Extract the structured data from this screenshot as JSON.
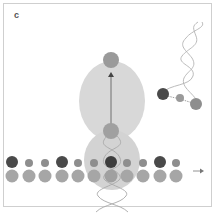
{
  "panel": {
    "label": "c"
  },
  "colors": {
    "dark_circle": "#4a4a4a",
    "mid_circle": "#8a8a8a",
    "light_circle": "#a6a6a6",
    "blob": "#d6d6d6",
    "strand": "#b5b5b5",
    "frame": "#cfcfcf"
  },
  "membrane": {
    "top_row": [
      {
        "x": 12,
        "r": 6,
        "tone": "dark"
      },
      {
        "x": 29,
        "r": 4,
        "tone": "mid"
      },
      {
        "x": 45,
        "r": 4,
        "tone": "mid"
      },
      {
        "x": 62,
        "r": 6,
        "tone": "dark"
      },
      {
        "x": 78,
        "r": 4,
        "tone": "mid"
      },
      {
        "x": 94,
        "r": 4,
        "tone": "mid"
      },
      {
        "x": 111,
        "r": 6,
        "tone": "dark"
      },
      {
        "x": 127,
        "r": 4,
        "tone": "mid"
      },
      {
        "x": 143,
        "r": 4,
        "tone": "mid"
      },
      {
        "x": 160,
        "r": 6,
        "tone": "dark"
      },
      {
        "x": 176,
        "r": 4,
        "tone": "mid"
      }
    ],
    "bottom_row": [
      12,
      29,
      45,
      62,
      78,
      94,
      111,
      127,
      143,
      160,
      176
    ]
  },
  "icons": {
    "arrow": "right-arrow-icon"
  }
}
